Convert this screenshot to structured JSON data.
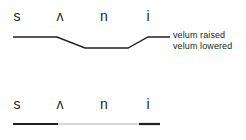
{
  "figure": {
    "colors": {
      "ink": "#231f20",
      "background": "#ffffff",
      "bar_closed": "#231f20",
      "bar_open": "#d9d9d9"
    }
  },
  "top_panel": {
    "symbols": [
      {
        "label": "s",
        "x": 9
      },
      {
        "label": "ʌ",
        "x": 52
      },
      {
        "label": "n",
        "x": 96
      },
      {
        "label": "i",
        "x": 140
      }
    ],
    "trace": {
      "description": "velum height trace",
      "points": "13,11 57,11 85,22 128,22 148,11 170,11",
      "high_level_label": "velum raised",
      "low_level_label": "velum lowered"
    },
    "annotations": [
      {
        "label": "velum raised"
      },
      {
        "label": "velum lowered"
      }
    ]
  },
  "bottom_panel": {
    "symbols": [
      {
        "label": "s",
        "x": 9
      },
      {
        "label": "ʌ",
        "x": 52
      },
      {
        "label": "n",
        "x": 96
      },
      {
        "label": "i",
        "x": 140
      }
    ],
    "bar": {
      "description": "velopharyngeal port state bar",
      "segments": [
        {
          "name": "closed-left",
          "x1": 13,
          "x2": 58,
          "color": "#231f20"
        },
        {
          "name": "open-middle",
          "x1": 58,
          "x2": 139,
          "color": "#d9d9d9"
        },
        {
          "name": "closed-right",
          "x1": 139,
          "x2": 160,
          "color": "#231f20"
        }
      ]
    }
  }
}
